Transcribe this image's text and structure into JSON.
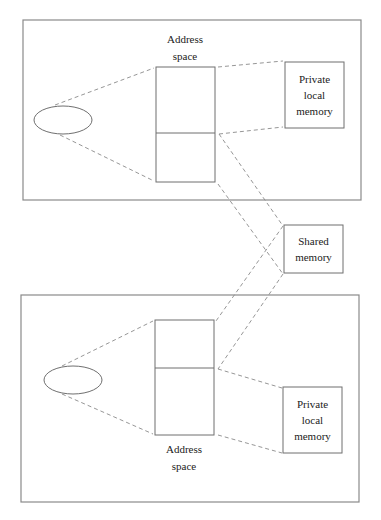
{
  "diagram": {
    "colors": {
      "frame": "#8a8a8a",
      "box": "#6f6f6f",
      "dash": "#8a8a8a",
      "text": "#222222"
    },
    "top_process": {
      "address_space_label_line1": "Address",
      "address_space_label_line2": "space",
      "private_memory_line1": "Private",
      "private_memory_line2": "local",
      "private_memory_line3": "memory"
    },
    "shared": {
      "line1": "Shared",
      "line2": "memory"
    },
    "bottom_process": {
      "address_space_label_line1": "Address",
      "address_space_label_line2": "space",
      "private_memory_line1": "Private",
      "private_memory_line2": "local",
      "private_memory_line3": "memory"
    }
  }
}
